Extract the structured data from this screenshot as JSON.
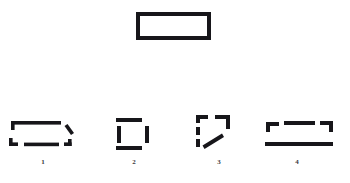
{
  "figure": {
    "background_color": "#ffffff",
    "ink_color": "#17161a",
    "caption_color": "#3a383c",
    "target": {
      "name": "complete-rectangle",
      "description": "solid outlined rectangle"
    },
    "fragments": [
      {
        "label": "1",
        "name": "fragmented-rectangle-1",
        "description": "rectangle outline broken into a top-left corner with long top edge, a short diagonal stroke at upper right, a bottom-left corner, a bottom middle segment and a bottom-right corner"
      },
      {
        "label": "2",
        "name": "fragmented-rectangle-2",
        "description": "rectangle reduced to four detached straight segments: top, left, right and bottom, with all four corners missing"
      },
      {
        "label": "3",
        "name": "fragmented-rectangle-3",
        "description": "top-left corner piece, top-right corner piece with vertical descender, two dashed left-edge pieces and an oblique stroke crossing the interior"
      },
      {
        "label": "4",
        "name": "fragmented-rectangle-4",
        "description": "top-left corner, detached top middle segment, top-right corner and one long unbroken bottom rule"
      }
    ]
  }
}
